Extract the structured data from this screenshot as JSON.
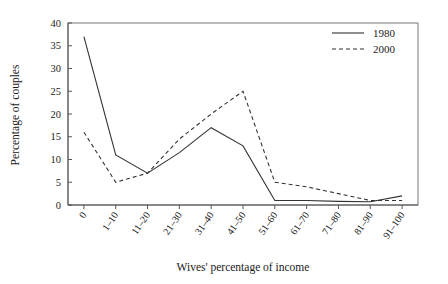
{
  "chart_data": {
    "type": "line",
    "title": "",
    "xlabel": "Wives' percentage of income",
    "ylabel": "Percentage of couples",
    "categories": [
      "0",
      "1–10",
      "11–20",
      "21–30",
      "31–40",
      "41–50",
      "51–60",
      "61–70",
      "71–80",
      "81–90",
      "91–100"
    ],
    "ylim": [
      0,
      40
    ],
    "yticks": [
      0,
      5,
      10,
      15,
      20,
      25,
      30,
      35,
      40
    ],
    "ytick_labels": [
      "0",
      "5",
      "10",
      "15",
      "20",
      "25",
      "30",
      "35",
      "40"
    ],
    "grid": false,
    "legend_position": "top-right",
    "series": [
      {
        "name": "1980",
        "style": "solid",
        "color": "#333333",
        "values": [
          37,
          11,
          7,
          11.5,
          17,
          13,
          1,
          1,
          0.8,
          0.7,
          2
        ]
      },
      {
        "name": "2000",
        "style": "dashed",
        "color": "#333333",
        "values": [
          16,
          5,
          7,
          14.5,
          20,
          25,
          5,
          4,
          2.5,
          1,
          1
        ]
      }
    ]
  },
  "legend": {
    "entries": [
      {
        "label": "1980",
        "style": "solid"
      },
      {
        "label": "2000",
        "style": "dashed"
      }
    ]
  }
}
